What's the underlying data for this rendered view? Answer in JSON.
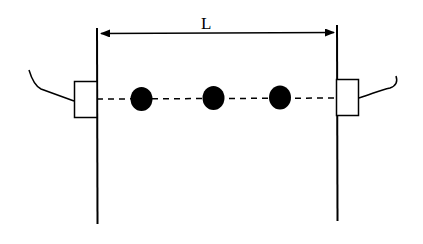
{
  "diagram": {
    "length_label": "L",
    "colors": {
      "stroke": "#000000",
      "background": "#ffffff",
      "dot": "#000000"
    },
    "dots": [
      {
        "cx": 141,
        "cy": 98
      },
      {
        "cx": 213,
        "cy": 98
      },
      {
        "cx": 280,
        "cy": 97
      }
    ]
  }
}
